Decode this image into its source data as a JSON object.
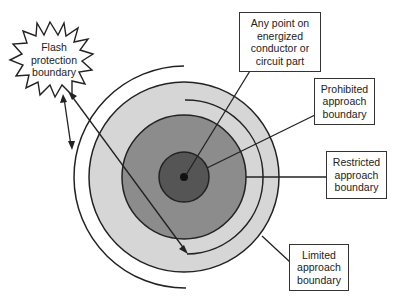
{
  "diagram": {
    "labels": {
      "flash": [
        "Flash",
        "protection",
        "boundary"
      ],
      "energized": [
        "Any point on",
        "energized",
        "conductor or",
        "circuit part"
      ],
      "prohibited": [
        "Prohibited",
        "approach",
        "boundary"
      ],
      "restricted": [
        "Restricted",
        "approach",
        "boundary"
      ],
      "limited": [
        "Limited",
        "approach",
        "boundary"
      ]
    },
    "colors": {
      "outer_zone": "#d6d6d6",
      "middle_zone": "#8c8c8c",
      "inner_zone": "#555555",
      "line": "#222222"
    }
  }
}
